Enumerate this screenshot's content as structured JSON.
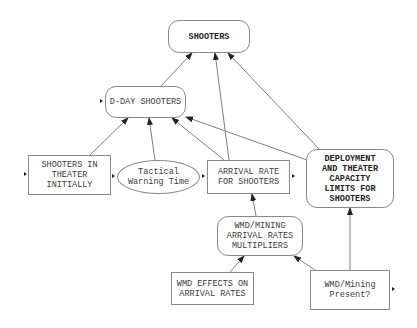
{
  "diagram": {
    "type": "causal-influence-diagram",
    "nodes": [
      {
        "id": "shooters",
        "label": "SHOOTERS",
        "shape": "rounded-rect",
        "bold": true
      },
      {
        "id": "dday",
        "label": "D-DAY SHOOTERS",
        "shape": "rounded-rect",
        "bold": false
      },
      {
        "id": "initial",
        "label": "SHOOTERS IN\nTHEATER\nINITIALLY",
        "shape": "rect",
        "bold": false
      },
      {
        "id": "warning",
        "label": "Tactical\nWarning Time",
        "shape": "ellipse",
        "bold": false
      },
      {
        "id": "arrival",
        "label": "ARRIVAL RATE\nFOR SHOOTERS",
        "shape": "rect",
        "bold": false
      },
      {
        "id": "deploy",
        "label": "DEPLOYMENT\nAND THEATER\nCAPACITY\nLIMITS FOR\nSHOOTERS",
        "shape": "rounded-rect",
        "bold": true
      },
      {
        "id": "multipliers",
        "label": "WMD/MINING\nARRIVAL RATES\nMULTIPLIERS",
        "shape": "rounded-rect",
        "bold": false
      },
      {
        "id": "effects",
        "label": "WMD EFFECTS ON\nARRIVAL RATES",
        "shape": "rect",
        "bold": false
      },
      {
        "id": "present",
        "label": "WMD/Mining\nPresent?",
        "shape": "rect",
        "bold": false
      }
    ],
    "edges": [
      {
        "from": "dday",
        "to": "shooters"
      },
      {
        "from": "arrival",
        "to": "shooters"
      },
      {
        "from": "deploy",
        "to": "shooters"
      },
      {
        "from": "initial",
        "to": "dday"
      },
      {
        "from": "warning",
        "to": "dday"
      },
      {
        "from": "arrival",
        "to": "dday"
      },
      {
        "from": "deploy",
        "to": "dday"
      },
      {
        "from": "multipliers",
        "to": "arrival"
      },
      {
        "from": "effects",
        "to": "multipliers"
      },
      {
        "from": "present",
        "to": "multipliers"
      },
      {
        "from": "present",
        "to": "deploy"
      }
    ],
    "colors": {
      "line": "#6f6f6f",
      "arrowhead": "#222222",
      "border": "#8a8a8a",
      "text": "#3a3a3a"
    }
  }
}
